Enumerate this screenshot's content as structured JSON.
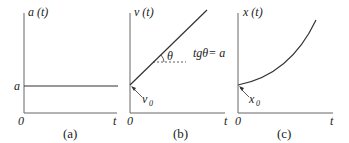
{
  "panels": [
    {
      "id": "a",
      "y_label": "a (t)",
      "x_label": "t",
      "origin_label": "0",
      "level_label": "a",
      "caption": "(a)",
      "description": "constant acceleration: horizontal line at a"
    },
    {
      "id": "b",
      "y_label": "v (t)",
      "x_label": "t",
      "origin_label": "0",
      "intercept_label": "v",
      "intercept_sub": "0",
      "angle_label": "θ",
      "slope_text": "tgθ= a",
      "caption": "(b)",
      "description": "velocity increasing linearly from v0 with slope a"
    },
    {
      "id": "c",
      "y_label": "x (t)",
      "x_label": "t",
      "origin_label": "0",
      "intercept_label": "x",
      "intercept_sub": "0",
      "caption": "(c)",
      "description": "position increasing quadratically from x0"
    }
  ],
  "colors": {
    "line": "#333333",
    "axis": "#666666",
    "background": "#ffffff"
  }
}
